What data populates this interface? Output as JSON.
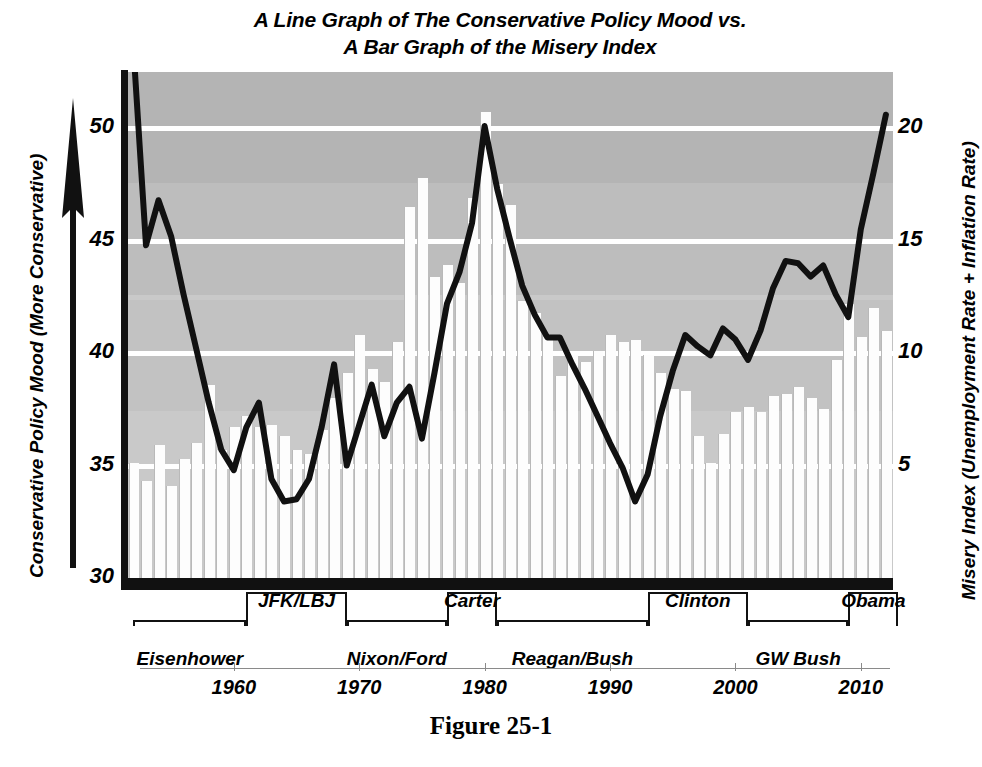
{
  "figure": {
    "title_line1": "A Line Graph of The Conservative Policy Mood vs.",
    "title_line2": "A Bar Graph of the Misery Index",
    "caption": "Figure 25-1"
  },
  "axes": {
    "left_title": "Conservative Policy Mood (More Conservative)",
    "right_title": "Misery Index (Unemployment Rate + Inflation Rate)",
    "left_ticks": [
      "30",
      "35",
      "40",
      "45",
      "50"
    ],
    "right_ticks": [
      "5",
      "10",
      "15",
      "20"
    ],
    "x_ticks": [
      "1960",
      "1970",
      "1980",
      "1990",
      "2000",
      "2010"
    ],
    "left_arrow_icon": "up-arrow-icon"
  },
  "presidents": [
    {
      "label": "Eisenhower",
      "start": 1952,
      "end": 1961,
      "row": "bottom"
    },
    {
      "label": "JFK/LBJ",
      "start": 1961,
      "end": 1969,
      "row": "top"
    },
    {
      "label": "Nixon/Ford",
      "start": 1969,
      "end": 1977,
      "row": "bottom"
    },
    {
      "label": "Carter",
      "start": 1977,
      "end": 1981,
      "row": "top"
    },
    {
      "label": "Reagan/Bush",
      "start": 1981,
      "end": 1993,
      "row": "bottom"
    },
    {
      "label": "Clinton",
      "start": 1993,
      "end": 2001,
      "row": "top"
    },
    {
      "label": "GW Bush",
      "start": 2001,
      "end": 2009,
      "row": "bottom"
    },
    {
      "label": "Obama",
      "start": 2009,
      "end": 2013,
      "row": "top"
    }
  ],
  "colors": {
    "plot_background": "#c9c9c9",
    "bar_fill": "#fdfdfd",
    "line_color": "#111111",
    "gridline_color": "#ffffff",
    "axis_color": "#111111"
  },
  "chart_data": {
    "type": "line",
    "title": "A Line Graph of The Conservative Policy Mood vs. A Bar Graph of the Misery Index",
    "xlabel": "",
    "ylabel": "Conservative Policy Mood (More Conservative)",
    "ylabel_secondary": "Misery Index (Unemployment Rate + Inflation Rate)",
    "xlim": [
      1952,
      2013
    ],
    "ylim": [
      30,
      52.5
    ],
    "ylim_secondary": [
      0,
      22.5
    ],
    "grid": true,
    "legend": "none",
    "x": [
      1952,
      1953,
      1954,
      1955,
      1956,
      1957,
      1958,
      1959,
      1960,
      1961,
      1962,
      1963,
      1964,
      1965,
      1966,
      1967,
      1968,
      1969,
      1970,
      1971,
      1972,
      1973,
      1974,
      1975,
      1976,
      1977,
      1978,
      1979,
      1980,
      1981,
      1982,
      1983,
      1984,
      1985,
      1986,
      1987,
      1988,
      1989,
      1990,
      1991,
      1992,
      1993,
      1994,
      1995,
      1996,
      1997,
      1998,
      1999,
      2000,
      2001,
      2002,
      2003,
      2004,
      2005,
      2006,
      2007,
      2008,
      2009,
      2010,
      2011,
      2012
    ],
    "series": [
      {
        "name": "Conservative Policy Mood (More Conservative)",
        "type": "line",
        "axis": "left",
        "color": "#111111",
        "values": [
          53.5,
          44.8,
          46.8,
          45.2,
          42.6,
          40.2,
          37.8,
          35.7,
          34.8,
          36.7,
          37.8,
          34.4,
          33.4,
          33.5,
          34.4,
          36.7,
          39.5,
          35.0,
          36.8,
          38.6,
          36.3,
          37.8,
          38.5,
          36.2,
          39.1,
          42.2,
          43.6,
          45.8,
          50.1,
          47.3,
          45.1,
          43.0,
          41.7,
          40.7,
          40.7,
          39.5,
          38.4,
          37.2,
          36.0,
          34.9,
          33.4,
          34.6,
          37.2,
          39.2,
          40.8,
          40.3,
          39.9,
          41.1,
          40.6,
          39.7,
          41.0,
          42.9,
          44.1,
          44.0,
          43.4,
          43.9,
          42.6,
          41.6,
          45.5,
          48.0,
          50.6
        ]
      },
      {
        "name": "Misery Index (Unemployment Rate + Inflation Rate)",
        "type": "bar",
        "axis": "right",
        "color": "#fdfdfd",
        "values": [
          5.1,
          4.3,
          5.9,
          4.1,
          5.3,
          6.0,
          8.6,
          5.7,
          6.7,
          7.2,
          6.7,
          6.8,
          6.3,
          5.7,
          5.5,
          6.6,
          8.0,
          9.1,
          10.8,
          9.3,
          8.7,
          10.5,
          16.5,
          17.8,
          13.4,
          13.9,
          13.1,
          16.9,
          20.7,
          17.5,
          16.6,
          12.3,
          11.8,
          10.7,
          9.0,
          9.9,
          9.6,
          10.1,
          10.8,
          10.5,
          10.6,
          9.9,
          9.1,
          8.4,
          8.3,
          6.3,
          5.1,
          6.4,
          7.4,
          7.6,
          7.4,
          8.1,
          8.2,
          8.5,
          8.0,
          7.5,
          9.7,
          12.2,
          10.7,
          12.0,
          11.0
        ]
      }
    ]
  }
}
